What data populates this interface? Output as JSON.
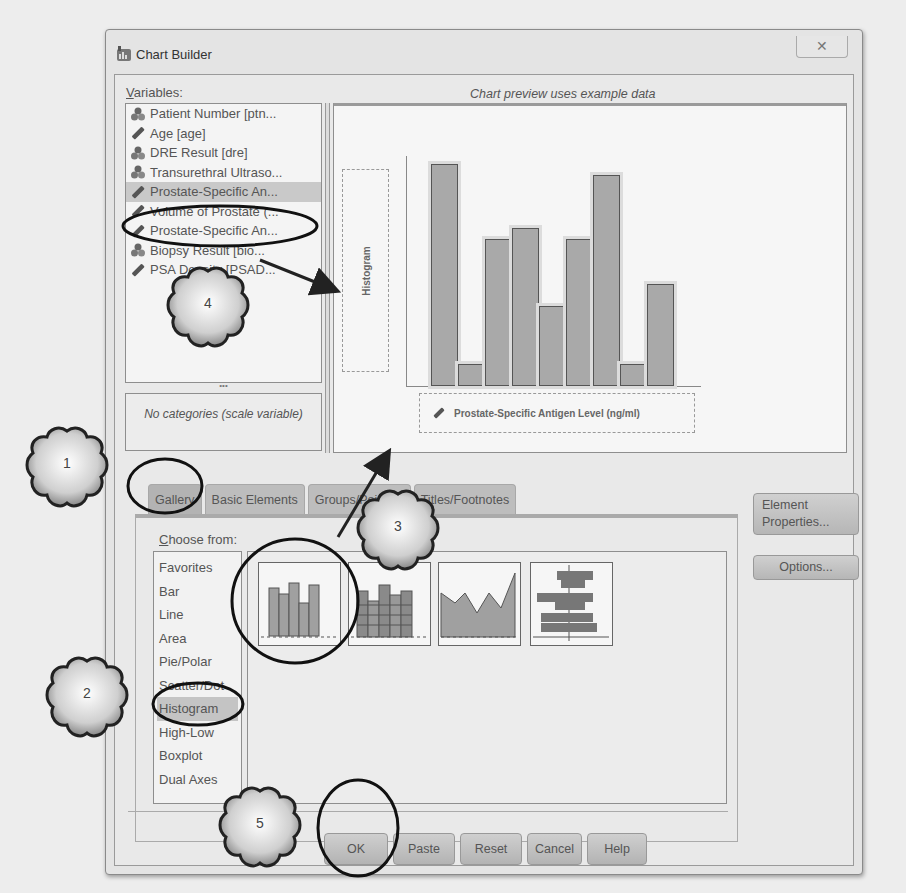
{
  "window": {
    "title": "Chart Builder",
    "close_label": "✕"
  },
  "variables": {
    "label_u": "V",
    "label_rest": "ariables:",
    "items": [
      {
        "label": "Patient Number [ptn...",
        "icon": "nominal-icon",
        "selected": false
      },
      {
        "label": "Age [age]",
        "icon": "scale-icon",
        "selected": false
      },
      {
        "label": "DRE Result [dre]",
        "icon": "nominal-icon",
        "selected": false
      },
      {
        "label": "Transurethral Ultraso...",
        "icon": "nominal-icon",
        "selected": false
      },
      {
        "label": "Prostate-Specific An...",
        "icon": "scale-icon",
        "selected": true
      },
      {
        "label": "Volume of Prostate (...",
        "icon": "scale-icon",
        "selected": false
      },
      {
        "label": "Prostate-Specific An...",
        "icon": "scale-icon",
        "selected": false
      },
      {
        "label": "Biopsy Result [bio...",
        "icon": "nominal-icon",
        "selected": false
      },
      {
        "label": "PSA Density [PSAD...",
        "icon": "scale-icon",
        "selected": false
      }
    ],
    "splitter_label": "•••",
    "categories_text": "No categories (scale variable)"
  },
  "preview": {
    "caption": "Chart preview uses example data",
    "y_dropzone_label": "Histogram",
    "x_dropzone_label": "Prostate-Specific Antigen Level (ng/ml)"
  },
  "chart_data": {
    "type": "bar",
    "title": "Histogram",
    "xlabel": "Prostate-Specific Antigen Level (ng/ml)",
    "ylabel": "",
    "categories": [
      "1",
      "2",
      "3",
      "4",
      "5",
      "6",
      "7",
      "8",
      "9"
    ],
    "values": [
      100,
      10,
      66,
      71,
      36,
      66,
      95,
      10,
      46
    ],
    "ylim": [
      0,
      100
    ],
    "grid": false,
    "note": "Example data preview; no axis tick labels shown"
  },
  "tabs": [
    {
      "label": "Gallery",
      "active": true
    },
    {
      "label": "Basic Elements",
      "active": false
    },
    {
      "label": "Groups/Point ID",
      "active": false
    },
    {
      "label": "Titles/Footnotes",
      "active": false
    }
  ],
  "gallery": {
    "choose_u": "C",
    "choose_rest": "hoose from:",
    "types": [
      {
        "label": "Favorites",
        "selected": false
      },
      {
        "label": "Bar",
        "selected": false
      },
      {
        "label": "Line",
        "selected": false
      },
      {
        "label": "Area",
        "selected": false
      },
      {
        "label": "Pie/Polar",
        "selected": false
      },
      {
        "label": "Scatter/Dot",
        "selected": false
      },
      {
        "label": "Histogram",
        "selected": true
      },
      {
        "label": "High-Low",
        "selected": false
      },
      {
        "label": "Boxplot",
        "selected": false
      },
      {
        "label": "Dual Axes",
        "selected": false
      }
    ],
    "thumbnails": [
      {
        "name": "simple-histogram-thumbnail"
      },
      {
        "name": "stacked-histogram-thumbnail"
      },
      {
        "name": "frequency-polygon-thumbnail"
      },
      {
        "name": "population-pyramid-thumbnail"
      }
    ]
  },
  "side_buttons": {
    "element_properties_line1": "Element",
    "element_properties_line2": "Properties...",
    "options": "Options..."
  },
  "buttons": {
    "ok": "OK",
    "paste": "Paste",
    "reset": "Reset",
    "cancel": "Cancel",
    "help": "Help"
  },
  "annotations": {
    "step1": "1",
    "step2": "2",
    "step3": "3",
    "step4": "4",
    "step5": "5"
  }
}
